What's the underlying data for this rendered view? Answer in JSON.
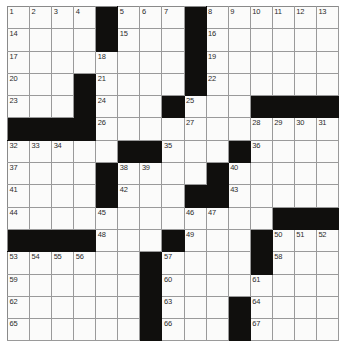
{
  "puzzle": {
    "title": "Crossword Grid",
    "rows": 15,
    "cols": 15,
    "cell_size_px": 22,
    "colors": {
      "block": "#100f0d",
      "cell": "#fbfbfa",
      "grid_line": "#9a9a9a",
      "number_text": "#2b2b2b"
    },
    "number_count": 67,
    "grid": [
      [
        {
          "block": false,
          "num": "1"
        },
        {
          "block": false,
          "num": "2"
        },
        {
          "block": false,
          "num": "3"
        },
        {
          "block": false,
          "num": "4"
        },
        {
          "block": true,
          "num": ""
        },
        {
          "block": false,
          "num": "5"
        },
        {
          "block": false,
          "num": "6"
        },
        {
          "block": false,
          "num": "7"
        },
        {
          "block": true,
          "num": ""
        },
        {
          "block": false,
          "num": "8"
        },
        {
          "block": false,
          "num": "9"
        },
        {
          "block": false,
          "num": "10"
        },
        {
          "block": false,
          "num": "11"
        },
        {
          "block": false,
          "num": "12"
        },
        {
          "block": false,
          "num": "13"
        }
      ],
      [
        {
          "block": false,
          "num": "14"
        },
        {
          "block": false,
          "num": ""
        },
        {
          "block": false,
          "num": ""
        },
        {
          "block": false,
          "num": ""
        },
        {
          "block": true,
          "num": ""
        },
        {
          "block": false,
          "num": "15"
        },
        {
          "block": false,
          "num": ""
        },
        {
          "block": false,
          "num": ""
        },
        {
          "block": true,
          "num": ""
        },
        {
          "block": false,
          "num": "16"
        },
        {
          "block": false,
          "num": ""
        },
        {
          "block": false,
          "num": ""
        },
        {
          "block": false,
          "num": ""
        },
        {
          "block": false,
          "num": ""
        },
        {
          "block": false,
          "num": ""
        }
      ],
      [
        {
          "block": false,
          "num": "17"
        },
        {
          "block": false,
          "num": ""
        },
        {
          "block": false,
          "num": ""
        },
        {
          "block": false,
          "num": ""
        },
        {
          "block": false,
          "num": "18"
        },
        {
          "block": false,
          "num": ""
        },
        {
          "block": false,
          "num": ""
        },
        {
          "block": false,
          "num": ""
        },
        {
          "block": true,
          "num": ""
        },
        {
          "block": false,
          "num": "19"
        },
        {
          "block": false,
          "num": ""
        },
        {
          "block": false,
          "num": ""
        },
        {
          "block": false,
          "num": ""
        },
        {
          "block": false,
          "num": ""
        },
        {
          "block": false,
          "num": ""
        }
      ],
      [
        {
          "block": false,
          "num": "20"
        },
        {
          "block": false,
          "num": ""
        },
        {
          "block": false,
          "num": ""
        },
        {
          "block": true,
          "num": ""
        },
        {
          "block": false,
          "num": "21"
        },
        {
          "block": false,
          "num": ""
        },
        {
          "block": false,
          "num": ""
        },
        {
          "block": false,
          "num": ""
        },
        {
          "block": true,
          "num": ""
        },
        {
          "block": false,
          "num": "22"
        },
        {
          "block": false,
          "num": ""
        },
        {
          "block": false,
          "num": ""
        },
        {
          "block": false,
          "num": ""
        },
        {
          "block": false,
          "num": ""
        },
        {
          "block": false,
          "num": ""
        }
      ],
      [
        {
          "block": false,
          "num": "23"
        },
        {
          "block": false,
          "num": ""
        },
        {
          "block": false,
          "num": ""
        },
        {
          "block": true,
          "num": ""
        },
        {
          "block": false,
          "num": "24"
        },
        {
          "block": false,
          "num": ""
        },
        {
          "block": false,
          "num": ""
        },
        {
          "block": true,
          "num": ""
        },
        {
          "block": false,
          "num": "25"
        },
        {
          "block": false,
          "num": ""
        },
        {
          "block": false,
          "num": ""
        },
        {
          "block": true,
          "num": ""
        },
        {
          "block": true,
          "num": ""
        },
        {
          "block": true,
          "num": ""
        },
        {
          "block": true,
          "num": ""
        }
      ],
      [
        {
          "block": true,
          "num": ""
        },
        {
          "block": true,
          "num": ""
        },
        {
          "block": true,
          "num": ""
        },
        {
          "block": true,
          "num": ""
        },
        {
          "block": false,
          "num": "26"
        },
        {
          "block": false,
          "num": ""
        },
        {
          "block": false,
          "num": ""
        },
        {
          "block": false,
          "num": ""
        },
        {
          "block": false,
          "num": "27"
        },
        {
          "block": false,
          "num": ""
        },
        {
          "block": false,
          "num": ""
        },
        {
          "block": false,
          "num": "28"
        },
        {
          "block": false,
          "num": "29"
        },
        {
          "block": false,
          "num": "30"
        },
        {
          "block": false,
          "num": "31"
        }
      ],
      [
        {
          "block": false,
          "num": "32"
        },
        {
          "block": false,
          "num": "33"
        },
        {
          "block": false,
          "num": "34"
        },
        {
          "block": false,
          "num": ""
        },
        {
          "block": false,
          "num": ""
        },
        {
          "block": true,
          "num": ""
        },
        {
          "block": true,
          "num": ""
        },
        {
          "block": false,
          "num": "35"
        },
        {
          "block": false,
          "num": ""
        },
        {
          "block": false,
          "num": ""
        },
        {
          "block": true,
          "num": ""
        },
        {
          "block": false,
          "num": "36"
        },
        {
          "block": false,
          "num": ""
        },
        {
          "block": false,
          "num": ""
        },
        {
          "block": false,
          "num": ""
        }
      ],
      [
        {
          "block": false,
          "num": "37"
        },
        {
          "block": false,
          "num": ""
        },
        {
          "block": false,
          "num": ""
        },
        {
          "block": false,
          "num": ""
        },
        {
          "block": true,
          "num": ""
        },
        {
          "block": false,
          "num": "38"
        },
        {
          "block": false,
          "num": "39"
        },
        {
          "block": false,
          "num": ""
        },
        {
          "block": false,
          "num": ""
        },
        {
          "block": true,
          "num": ""
        },
        {
          "block": false,
          "num": "40"
        },
        {
          "block": false,
          "num": ""
        },
        {
          "block": false,
          "num": ""
        },
        {
          "block": false,
          "num": ""
        },
        {
          "block": false,
          "num": ""
        }
      ],
      [
        {
          "block": false,
          "num": "41"
        },
        {
          "block": false,
          "num": ""
        },
        {
          "block": false,
          "num": ""
        },
        {
          "block": false,
          "num": ""
        },
        {
          "block": true,
          "num": ""
        },
        {
          "block": false,
          "num": "42"
        },
        {
          "block": false,
          "num": ""
        },
        {
          "block": false,
          "num": ""
        },
        {
          "block": true,
          "num": ""
        },
        {
          "block": true,
          "num": ""
        },
        {
          "block": false,
          "num": "43"
        },
        {
          "block": false,
          "num": ""
        },
        {
          "block": false,
          "num": ""
        },
        {
          "block": false,
          "num": ""
        },
        {
          "block": false,
          "num": ""
        }
      ],
      [
        {
          "block": false,
          "num": "44"
        },
        {
          "block": false,
          "num": ""
        },
        {
          "block": false,
          "num": ""
        },
        {
          "block": false,
          "num": ""
        },
        {
          "block": false,
          "num": "45"
        },
        {
          "block": false,
          "num": ""
        },
        {
          "block": false,
          "num": ""
        },
        {
          "block": false,
          "num": ""
        },
        {
          "block": false,
          "num": "46"
        },
        {
          "block": false,
          "num": "47"
        },
        {
          "block": false,
          "num": ""
        },
        {
          "block": false,
          "num": ""
        },
        {
          "block": true,
          "num": ""
        },
        {
          "block": true,
          "num": ""
        },
        {
          "block": true,
          "num": ""
        }
      ],
      [
        {
          "block": true,
          "num": ""
        },
        {
          "block": true,
          "num": ""
        },
        {
          "block": true,
          "num": ""
        },
        {
          "block": true,
          "num": ""
        },
        {
          "block": false,
          "num": "48"
        },
        {
          "block": false,
          "num": ""
        },
        {
          "block": false,
          "num": ""
        },
        {
          "block": true,
          "num": ""
        },
        {
          "block": false,
          "num": "49"
        },
        {
          "block": false,
          "num": ""
        },
        {
          "block": false,
          "num": ""
        },
        {
          "block": true,
          "num": ""
        },
        {
          "block": false,
          "num": "50"
        },
        {
          "block": false,
          "num": "51"
        },
        {
          "block": false,
          "num": "52"
        }
      ],
      [
        {
          "block": false,
          "num": "53"
        },
        {
          "block": false,
          "num": "54"
        },
        {
          "block": false,
          "num": "55"
        },
        {
          "block": false,
          "num": "56"
        },
        {
          "block": false,
          "num": ""
        },
        {
          "block": false,
          "num": ""
        },
        {
          "block": true,
          "num": ""
        },
        {
          "block": false,
          "num": "57"
        },
        {
          "block": false,
          "num": ""
        },
        {
          "block": false,
          "num": ""
        },
        {
          "block": false,
          "num": ""
        },
        {
          "block": true,
          "num": ""
        },
        {
          "block": false,
          "num": "58"
        },
        {
          "block": false,
          "num": ""
        },
        {
          "block": false,
          "num": ""
        }
      ],
      [
        {
          "block": false,
          "num": "59"
        },
        {
          "block": false,
          "num": ""
        },
        {
          "block": false,
          "num": ""
        },
        {
          "block": false,
          "num": ""
        },
        {
          "block": false,
          "num": ""
        },
        {
          "block": false,
          "num": ""
        },
        {
          "block": true,
          "num": ""
        },
        {
          "block": false,
          "num": "60"
        },
        {
          "block": false,
          "num": ""
        },
        {
          "block": false,
          "num": ""
        },
        {
          "block": false,
          "num": ""
        },
        {
          "block": false,
          "num": "61"
        },
        {
          "block": false,
          "num": ""
        },
        {
          "block": false,
          "num": ""
        },
        {
          "block": false,
          "num": ""
        }
      ],
      [
        {
          "block": false,
          "num": "62"
        },
        {
          "block": false,
          "num": ""
        },
        {
          "block": false,
          "num": ""
        },
        {
          "block": false,
          "num": ""
        },
        {
          "block": false,
          "num": ""
        },
        {
          "block": false,
          "num": ""
        },
        {
          "block": true,
          "num": ""
        },
        {
          "block": false,
          "num": "63"
        },
        {
          "block": false,
          "num": ""
        },
        {
          "block": false,
          "num": ""
        },
        {
          "block": true,
          "num": ""
        },
        {
          "block": false,
          "num": "64"
        },
        {
          "block": false,
          "num": ""
        },
        {
          "block": false,
          "num": ""
        },
        {
          "block": false,
          "num": ""
        }
      ],
      [
        {
          "block": false,
          "num": "65"
        },
        {
          "block": false,
          "num": ""
        },
        {
          "block": false,
          "num": ""
        },
        {
          "block": false,
          "num": ""
        },
        {
          "block": false,
          "num": ""
        },
        {
          "block": false,
          "num": ""
        },
        {
          "block": true,
          "num": ""
        },
        {
          "block": false,
          "num": "66"
        },
        {
          "block": false,
          "num": ""
        },
        {
          "block": false,
          "num": ""
        },
        {
          "block": true,
          "num": ""
        },
        {
          "block": false,
          "num": "67"
        },
        {
          "block": false,
          "num": ""
        },
        {
          "block": false,
          "num": ""
        },
        {
          "block": false,
          "num": ""
        }
      ]
    ]
  }
}
